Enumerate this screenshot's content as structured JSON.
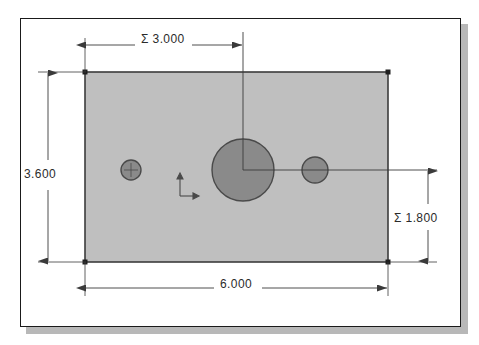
{
  "app": {
    "kind": "cad-drawing-view",
    "background_color": "#ffffff",
    "frame_border_color": "#1a1a1a",
    "frame_shadow_color": "#b8b8b8"
  },
  "drawing": {
    "part_name": "rectangular-plate-with-three-holes",
    "plate_fill_color": "#bfbfbf",
    "plate_edge_color": "#3c3c3c",
    "hole_fill_color": "#8a8a8a",
    "hole_edge_color": "#4a4a4a",
    "dimension_line_color": "#3a3a3a",
    "origin_marker": "origin-axes-icon",
    "vertices": [
      {
        "name": "top-left-vertex"
      },
      {
        "name": "top-right-vertex"
      },
      {
        "name": "bottom-left-vertex"
      },
      {
        "name": "bottom-right-vertex"
      }
    ],
    "holes": [
      {
        "name": "small-hole-left",
        "size": "small"
      },
      {
        "name": "large-hole-center",
        "size": "large"
      },
      {
        "name": "small-hole-right",
        "size": "small"
      }
    ]
  },
  "dimensions": {
    "top": {
      "name": "horizontal-hole-position",
      "prefix": "Σ",
      "value": "3.000",
      "label": "Σ 3.000",
      "orientation": "horizontal"
    },
    "left": {
      "name": "plate-height",
      "prefix": "",
      "value": "3.600",
      "label": "3.600",
      "orientation": "vertical"
    },
    "right": {
      "name": "vertical-hole-position",
      "prefix": "Σ",
      "value": "1.800",
      "label": "Σ 1.800",
      "orientation": "vertical"
    },
    "bottom": {
      "name": "plate-width",
      "prefix": "",
      "value": "6.000",
      "label": "6.000",
      "orientation": "horizontal"
    }
  }
}
